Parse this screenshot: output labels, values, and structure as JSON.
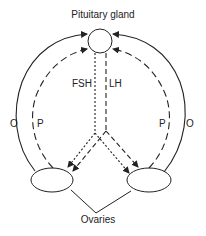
{
  "diagram": {
    "title": "Pituitary gland",
    "nodes": {
      "pituitary": {
        "label": "Pituitary gland",
        "cx": 100,
        "cy": 41,
        "r": 12
      },
      "ovary_left": {
        "cx": 52,
        "cy": 180,
        "rx": 21,
        "ry": 12
      },
      "ovary_right": {
        "cx": 149,
        "cy": 180,
        "rx": 22,
        "ry": 12
      }
    },
    "labels": {
      "fsh": "FSH",
      "lh": "LH",
      "o_left": "O",
      "p_left": "P",
      "p_right": "P",
      "o_right": "O",
      "ovaries": "Ovaries"
    },
    "edges": [
      {
        "from": "ovary_left",
        "to": "pituitary",
        "style": "solid",
        "label": "O"
      },
      {
        "from": "ovary_left",
        "to": "pituitary",
        "style": "long-dashed",
        "label": "P"
      },
      {
        "from": "ovary_right",
        "to": "pituitary",
        "style": "solid",
        "label": "O"
      },
      {
        "from": "ovary_right",
        "to": "pituitary",
        "style": "long-dashed",
        "label": "P"
      },
      {
        "from": "pituitary",
        "to": "ovary_left",
        "style": "short-dashed",
        "label": "FSH"
      },
      {
        "from": "pituitary",
        "to": "ovary_right",
        "style": "short-dashed",
        "label": "FSH"
      },
      {
        "from": "pituitary",
        "to": "ovary_left",
        "style": "long-dashed",
        "label": "LH"
      },
      {
        "from": "pituitary",
        "to": "ovary_right",
        "style": "long-dashed",
        "label": "LH"
      }
    ],
    "colors": {
      "stroke": "#222222",
      "background": "#ffffff"
    }
  }
}
